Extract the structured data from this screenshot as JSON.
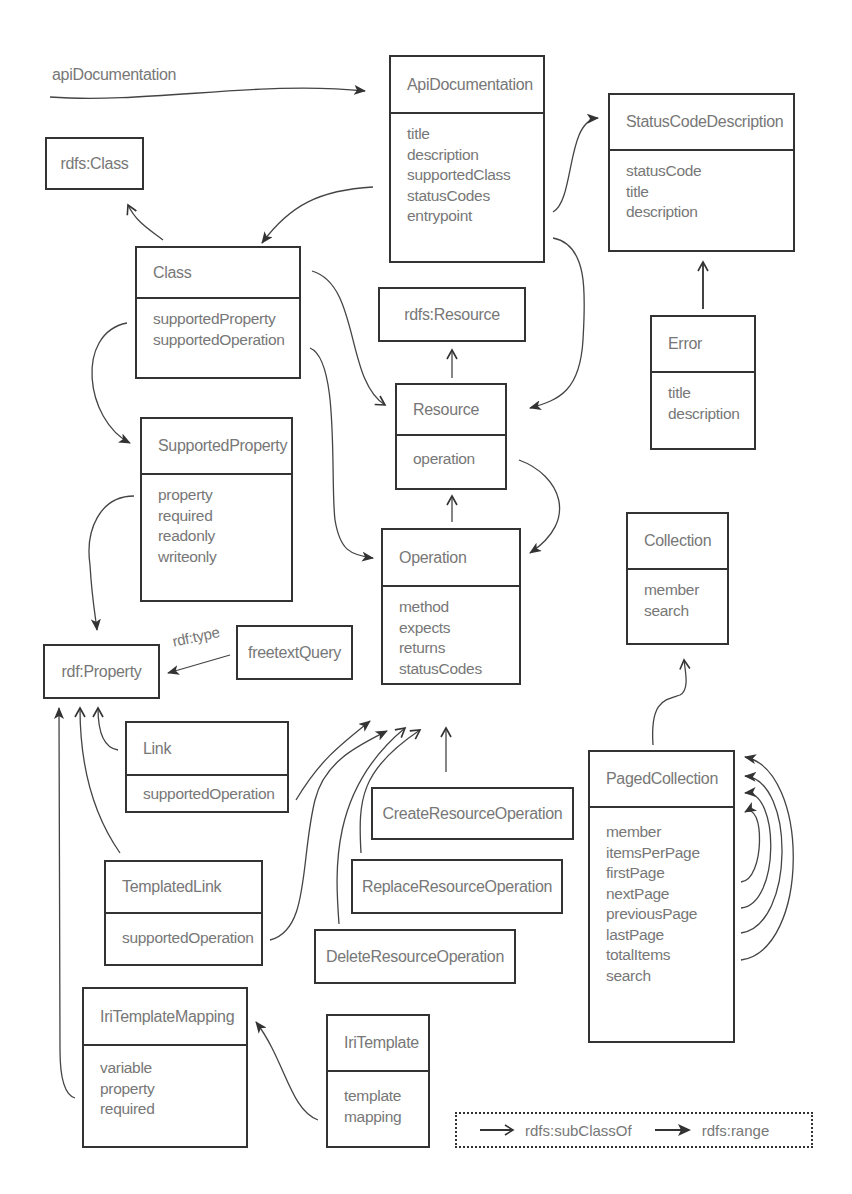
{
  "diagram": {
    "entry_label": "apiDocumentation",
    "rdf_type_label": "rdf:type",
    "boxes": {
      "apiDocumentation": {
        "title": "ApiDocumentation",
        "props": [
          "title",
          "description",
          "supportedClass",
          "statusCodes",
          "entrypoint"
        ]
      },
      "statusCodeDescription": {
        "title": "StatusCodeDescription",
        "props": [
          "statusCode",
          "title",
          "description"
        ]
      },
      "rdfsClass": {
        "title": "rdfs:Class"
      },
      "class": {
        "title": "Class",
        "props": [
          "supportedProperty",
          "supportedOperation"
        ]
      },
      "rdfsResource": {
        "title": "rdfs:Resource"
      },
      "error": {
        "title": "Error",
        "props": [
          "title",
          "description"
        ]
      },
      "resource": {
        "title": "Resource",
        "props": [
          "operation"
        ]
      },
      "supportedProperty": {
        "title": "SupportedProperty",
        "props": [
          "property",
          "required",
          "readonly",
          "writeonly"
        ]
      },
      "operation": {
        "title": "Operation",
        "props": [
          "method",
          "expects",
          "returns",
          "statusCodes"
        ]
      },
      "collection": {
        "title": "Collection",
        "props": [
          "member",
          "search"
        ]
      },
      "rdfProperty": {
        "title": "rdf:Property"
      },
      "freetextQuery": {
        "title": "freetextQuery"
      },
      "link": {
        "title": "Link",
        "props": [
          "supportedOperation"
        ]
      },
      "createResourceOperation": {
        "title": "CreateResourceOperation"
      },
      "pagedCollection": {
        "title": "PagedCollection",
        "props": [
          "member",
          "itemsPerPage",
          "firstPage",
          "nextPage",
          "previousPage",
          "lastPage",
          "totalItems",
          "search"
        ]
      },
      "replaceResourceOperation": {
        "title": "ReplaceResourceOperation"
      },
      "templatedLink": {
        "title": "TemplatedLink",
        "props": [
          "supportedOperation"
        ]
      },
      "deleteResourceOperation": {
        "title": "DeleteResourceOperation"
      },
      "iriTemplateMapping": {
        "title": "IriTemplateMapping",
        "props": [
          "variable",
          "property",
          "required"
        ]
      },
      "iriTemplate": {
        "title": "IriTemplate",
        "props": [
          "template",
          "mapping"
        ]
      }
    },
    "legend": {
      "subclass_label": "rdfs:subClassOf",
      "range_label": "rdfs:range",
      "subclass_icon": "open-arrow-icon",
      "range_icon": "filled-arrow-icon"
    },
    "colors": {
      "line": "#333333",
      "text": "#777777",
      "background": "#ffffff"
    }
  }
}
